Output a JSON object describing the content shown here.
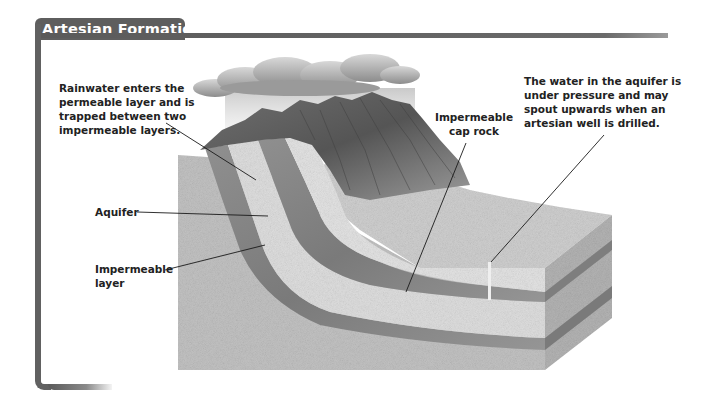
{
  "title": "Artesian Formation",
  "labels": {
    "rainwater": "Rainwater enters the permeable layer and is trapped between two impermeable layers.",
    "pressure": "The water in the aquifer is under pressure and may spout upwards when an artesian well is drilled.",
    "cap_rock": "Impermeable cap rock",
    "aquifer": "Aquifer",
    "impermeable_layer": "Impermeable layer"
  },
  "colors": {
    "frame": "#5e5e5e",
    "title_text": "#ffffff",
    "label_text": "#222222",
    "rock_light": "#d9d9d9",
    "rock_mid": "#b8b8b8",
    "rock_dark": "#8a8a8a",
    "cloud": "#a8a8a8"
  }
}
